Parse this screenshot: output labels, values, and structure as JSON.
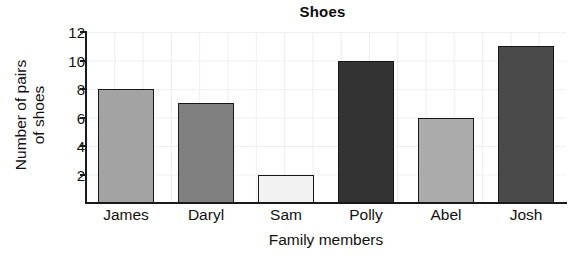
{
  "chart_data": {
    "type": "bar",
    "title": "Shoes",
    "xlabel": "Family members",
    "ylabel": "Number of pairs of shoes",
    "ylabel_lines": [
      "Number of pairs",
      "of shoes"
    ],
    "categories": [
      "James",
      "Daryl",
      "Sam",
      "Polly",
      "Abel",
      "Josh"
    ],
    "values": [
      8,
      7,
      2,
      10,
      6,
      11
    ],
    "bar_colors": [
      "#a3a3a3",
      "#808080",
      "#f2f2f2",
      "#333333",
      "#ababab",
      "#4a4a4a"
    ],
    "bar_edge_color": "#171717",
    "ylim": [
      0,
      12
    ],
    "yticks": [
      2,
      4,
      6,
      8,
      10,
      12
    ],
    "ytick_labels": [
      "2",
      "4",
      "6",
      "8",
      "10",
      "12"
    ],
    "grid": true,
    "grid_color": "#ededed",
    "legend": null,
    "axis_color": "#1a1a1a",
    "background": "#ffffff"
  }
}
